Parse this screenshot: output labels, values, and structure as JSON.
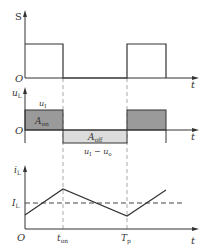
{
  "colors": {
    "line": "#333333",
    "grid_dash": "#999999",
    "area_on": "#9a9a9a",
    "area_off": "#dcdcdc"
  },
  "plots": {
    "s": {
      "ylabel": "S",
      "origin": "O",
      "xlabel": "t"
    },
    "ul": {
      "ylabel_main": "u",
      "ylabel_sub": "L",
      "origin": "O",
      "xlabel": "t",
      "level_on_main": "u",
      "level_on_sub": "I",
      "area_on_main": "A",
      "area_on_sub": "on",
      "area_off_main": "A",
      "area_off_sub": "off",
      "level_off_a": "u",
      "level_off_a_sub": "I",
      "level_off_minus": " − ",
      "level_off_b": "u",
      "level_off_b_sub": "o"
    },
    "il": {
      "ylabel_main": "i",
      "ylabel_sub": "L",
      "avg_main": "I",
      "avg_sub": "L",
      "origin": "O",
      "xlabel": "t",
      "tick_ton_main": "t",
      "tick_ton_sub": "on",
      "tick_tp_main": "T",
      "tick_tp_sub": "p"
    }
  }
}
